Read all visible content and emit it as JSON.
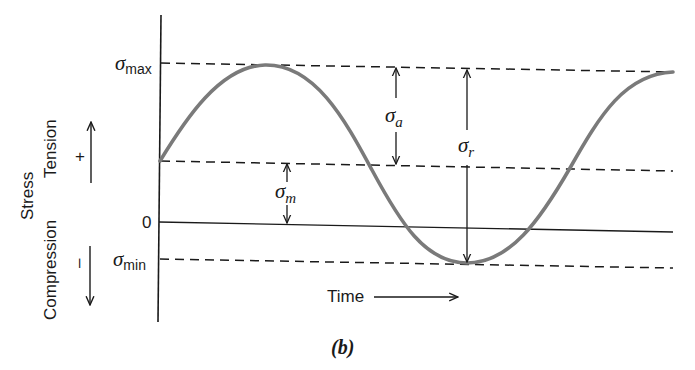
{
  "diagram": {
    "caption": "(b)",
    "axis": {
      "y_title": "Stress",
      "positive_label": "Tension",
      "positive_sign": "+",
      "negative_label": "Compression",
      "negative_sign": "–",
      "x_title": "Time"
    },
    "levels": {
      "max": {
        "symbol": "σ",
        "sub": "max"
      },
      "zero": {
        "label": "0"
      },
      "min": {
        "symbol": "σ",
        "sub": "min"
      }
    },
    "dimensions": {
      "amplitude": {
        "symbol": "σ",
        "sub": "a"
      },
      "range": {
        "symbol": "σ",
        "sub": "r"
      },
      "mean": {
        "symbol": "σ",
        "sub": "m"
      }
    },
    "colors": {
      "curve": "#7a7a7a",
      "lines": "#1a1a1a",
      "background": "#ffffff"
    }
  }
}
